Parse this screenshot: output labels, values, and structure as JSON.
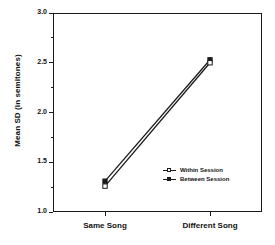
{
  "chart_data": {
    "type": "line",
    "title": "Production",
    "xlabel": "",
    "ylabel": "Mean SD (in semitones)",
    "categories": [
      "Same Song",
      "Different Song"
    ],
    "ylim": [
      1.0,
      3.0
    ],
    "ytick_labels": [
      "1.0",
      "1.5",
      "2.0",
      "2.5",
      "3.0"
    ],
    "ytick_values": [
      1.0,
      1.5,
      2.0,
      2.5,
      3.0
    ],
    "yminor_values": [
      1.25,
      1.75,
      2.25,
      2.75
    ],
    "grid": false,
    "legend_position": "lower-right-inside",
    "series": [
      {
        "name": "Within Session",
        "marker": "open-square",
        "values": [
          1.26,
          2.5
        ]
      },
      {
        "name": "Between Session",
        "marker": "filled-square",
        "values": [
          1.31,
          2.53
        ]
      }
    ]
  },
  "figure": {
    "axis_color": "#1a1a1a",
    "line_color": "#1a1a1a",
    "background": "#ffffff"
  }
}
